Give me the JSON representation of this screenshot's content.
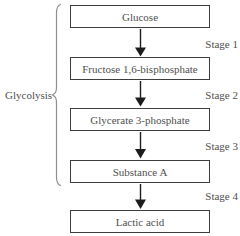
{
  "diagram": {
    "brace_label": "Glycolysis",
    "boxes": [
      {
        "label": "Glucose"
      },
      {
        "label": "Fructose 1,6-bisphosphate"
      },
      {
        "label": "Glycerate 3-phosphate"
      },
      {
        "label": "Substance A"
      },
      {
        "label": "Lactic acid"
      }
    ],
    "stages": [
      {
        "label": "Stage 1"
      },
      {
        "label": "Stage 2"
      },
      {
        "label": "Stage 3"
      },
      {
        "label": "Stage 4"
      }
    ],
    "colors": {
      "background": "#ffffff",
      "box_border": "#3d3d3d",
      "text": "#4f4f4f",
      "arrow": "#1c1c1c",
      "brace": "#8f8f8f"
    }
  }
}
